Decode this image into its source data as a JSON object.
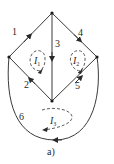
{
  "figure": {
    "caption": "a)",
    "nodes": [
      {
        "id": "top",
        "x": 52,
        "y": 13
      },
      {
        "id": "left",
        "x": 9,
        "y": 57
      },
      {
        "id": "right",
        "x": 97,
        "y": 57
      },
      {
        "id": "bottom",
        "x": 52,
        "y": 101
      }
    ],
    "edges": [
      {
        "label": "1",
        "from": "left",
        "to": "top"
      },
      {
        "label": "2",
        "from": "bottom",
        "to": "left"
      },
      {
        "label": "3",
        "from": "top",
        "to": "bottom"
      },
      {
        "label": "4",
        "from": "top",
        "to": "right"
      },
      {
        "label": "5",
        "from": "bottom",
        "to": "right"
      },
      {
        "label": "6",
        "from": "right",
        "to": "left",
        "shape": "outer-curve"
      }
    ],
    "loops": [
      {
        "main": "I",
        "sub": "1"
      },
      {
        "main": "I",
        "sub": "2"
      },
      {
        "main": "I",
        "sub": "3"
      }
    ],
    "colors": {
      "line": "#3a3a3a",
      "background": "#ffffff"
    }
  }
}
